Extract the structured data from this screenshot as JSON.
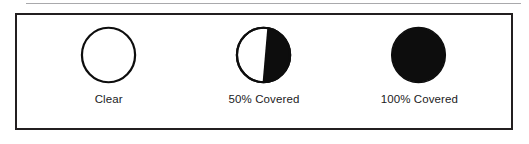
{
  "figure": {
    "top_rule": "horizontal-rule",
    "border_color": "#231f20",
    "background_color": "#ffffff",
    "fill_color": "#000000",
    "text_color": "#1b1b1d",
    "symbols": [
      {
        "key": "clear",
        "label": "Clear",
        "coverage_percent": 0,
        "glyph": "open-circle-outline"
      },
      {
        "key": "half-covered",
        "label": "50% Covered",
        "coverage_percent": 50,
        "glyph": "half-filled-circle"
      },
      {
        "key": "fully-covered",
        "label": "100% Covered",
        "coverage_percent": 100,
        "glyph": "filled-circle"
      }
    ]
  }
}
